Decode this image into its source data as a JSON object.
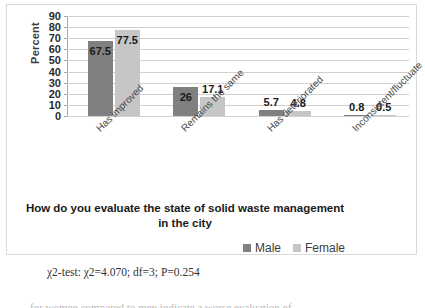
{
  "chart_data": {
    "type": "bar",
    "title": "",
    "xlabel": "How do you evaluate the state of solid waste management in the city",
    "ylabel": "Percent",
    "ylim": [
      0,
      90
    ],
    "ytick_step": 10,
    "yticks": [
      "90",
      "80",
      "70",
      "60",
      "50",
      "40",
      "30",
      "20",
      "10",
      "0"
    ],
    "grid": true,
    "legend_position": "bottom-right",
    "categories": [
      "Has improved",
      "Remains the same",
      "Has deteriorated",
      "Inconsistent/fluctuate"
    ],
    "series": [
      {
        "name": "Male",
        "color": "#808080",
        "values": [
          67.5,
          26,
          5.7,
          0.8
        ],
        "labels": [
          "67.5",
          "26",
          "5.7",
          "0.8"
        ]
      },
      {
        "name": "Female",
        "color": "#c6c6c6",
        "values": [
          77.5,
          17.1,
          4.8,
          0.5
        ],
        "labels": [
          "77.5",
          "17.1",
          "4.8",
          "0.5"
        ]
      }
    ]
  },
  "axis_titles": {
    "x_line1": "How do you evaluate the state of solid waste management",
    "x_line2": "in the city",
    "y": "Percent"
  },
  "legend": {
    "items": [
      {
        "label": "Male"
      },
      {
        "label": "Female"
      }
    ]
  },
  "caption": {
    "text": "χ2-test: χ2=4.070; df=3; P=0.254"
  },
  "footer": {
    "fragment": "for women compared to men indicate a worse evaluation of"
  },
  "colors": {
    "male": "#808080",
    "female": "#c6c6c6",
    "gridline": "#d0d0d0",
    "axis": "#a6a6a6",
    "frame_border": "#d9d9d9"
  }
}
